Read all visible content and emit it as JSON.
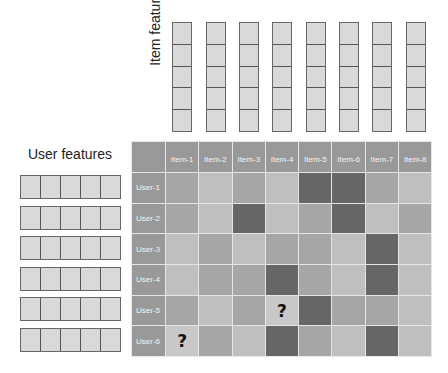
{
  "labels": {
    "item_features": "Item features",
    "user_features": "User features"
  },
  "item_feature_vectors": {
    "count": 8,
    "dimensions": 5
  },
  "user_feature_vectors": {
    "count": 6,
    "dimensions": 5
  },
  "matrix": {
    "columns": [
      "Item-1",
      "Item-2",
      "Item-3",
      "Item-4",
      "Item-5",
      "Item-6",
      "Item-7",
      "Item-8"
    ],
    "rows": [
      {
        "label": "User-1",
        "cells": [
          "med",
          "light",
          "med",
          "light",
          "dark",
          "dark",
          "med",
          "light"
        ]
      },
      {
        "label": "User-2",
        "cells": [
          "med",
          "light",
          "dark",
          "light",
          "med",
          "dark",
          "light",
          "med"
        ]
      },
      {
        "label": "User-3",
        "cells": [
          "light",
          "med",
          "light",
          "med",
          "med",
          "light",
          "dark",
          "light"
        ]
      },
      {
        "label": "User-4",
        "cells": [
          "light",
          "med",
          "med",
          "dark",
          "med",
          "light",
          "dark",
          "light"
        ]
      },
      {
        "label": "User-5",
        "cells": [
          "med",
          "light",
          "med",
          "unknown",
          "dark",
          "med",
          "med",
          "light"
        ]
      },
      {
        "label": "User-6",
        "cells": [
          "unknown",
          "med",
          "light",
          "dark",
          "med",
          "light",
          "dark",
          "light"
        ]
      }
    ],
    "unknown_symbol": "?"
  },
  "colors": {
    "header": "#999999",
    "light": "#bfbfbf",
    "medium": "#a6a6a6",
    "dark": "#666666",
    "feature_cell": "#d9d9d9"
  }
}
